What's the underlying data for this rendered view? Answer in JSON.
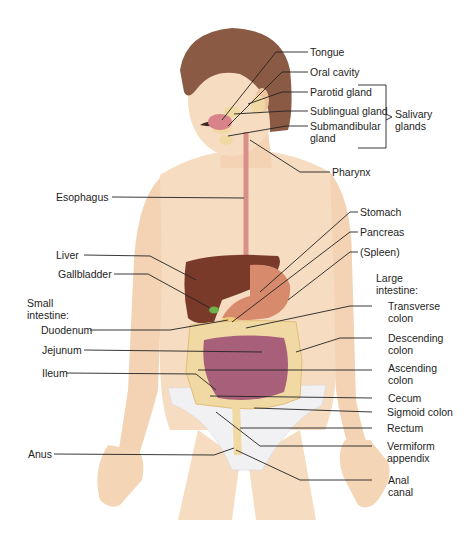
{
  "diagram": {
    "labels_right": {
      "tongue": "Tongue",
      "oral_cavity": "Oral cavity",
      "parotid_gland": "Parotid gland",
      "sublingual_gland": "Sublingual gland",
      "submandibular_gland": "Submandibular\ngland",
      "salivary_glands": "Salivary\nglands",
      "pharynx": "Pharynx",
      "stomach": "Stomach",
      "pancreas": "Pancreas",
      "spleen": "(Spleen)",
      "large_intestine_heading": "Large\nintestine:",
      "transverse_colon": "Transverse\ncolon",
      "descending_colon": "Descending\ncolon",
      "ascending_colon": "Ascending\ncolon",
      "cecum": "Cecum",
      "sigmoid_colon": "Sigmoid colon",
      "rectum": "Rectum",
      "vermiform_appendix": "Vermiform\nappendix",
      "anal_canal": "Anal\ncanal"
    },
    "labels_left": {
      "esophagus": "Esophagus",
      "liver": "Liver",
      "gallbladder": "Gallbladder",
      "small_intestine_heading": "Small\nintestine:",
      "duodenum": "Duodenum",
      "jejunum": "Jejunum",
      "ileum": "Ileum",
      "anus": "Anus"
    },
    "colors": {
      "skin": "#f6dcc0",
      "skin_shadow": "#e9b98f",
      "hair": "#8a5a44",
      "liver": "#7a3a2a",
      "stomach": "#d88a6c",
      "small_intestine": "#a8607a",
      "large_intestine": "#f1d9a4",
      "underwear": "#f1f1f3",
      "gallbladder": "#6bb24a",
      "esophagus": "#d98f8a",
      "leader_line": "#222222"
    }
  }
}
